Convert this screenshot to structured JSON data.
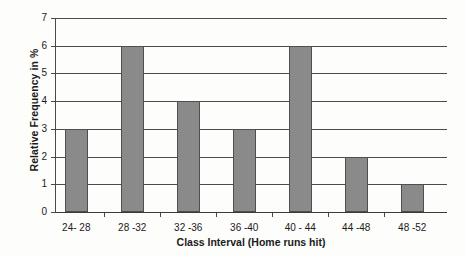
{
  "chart_data": {
    "type": "bar",
    "title": "",
    "xlabel": "Class Interval (Home runs hit)",
    "ylabel": "Relative Frequency in %",
    "categories": [
      "24- 28",
      "28 -32",
      "32 -36",
      "36 -40",
      "40 - 44",
      "44 -48",
      "48 -52"
    ],
    "values": [
      3,
      6,
      4,
      3,
      6,
      2,
      1
    ],
    "ylim": [
      0,
      7
    ],
    "ytick_labels": [
      "0",
      "1",
      "2",
      "3",
      "4",
      "5",
      "6",
      "7"
    ],
    "ytick_values": [
      0,
      1,
      2,
      3,
      4,
      5,
      6,
      7
    ],
    "grid": "horizontal",
    "legend": "none",
    "bar_color": "#8a8a8a",
    "bar_edge_color": "#4f4f4f",
    "axis_color": "#4a4a4a",
    "background_color": "#fdfdfb"
  }
}
